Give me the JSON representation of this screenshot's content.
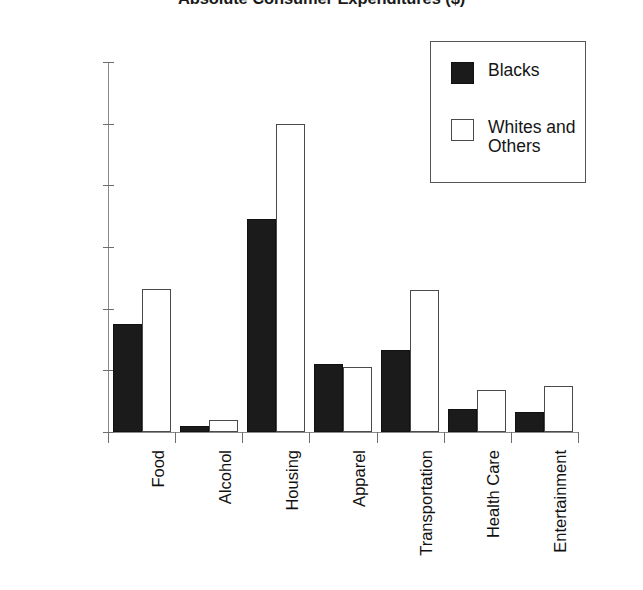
{
  "chart_data": {
    "type": "bar",
    "title": "Absolute Consumer Expenditures ($)",
    "xlabel": "",
    "ylabel": "",
    "ylim": [
      0,
      12000
    ],
    "grid": false,
    "legend_position": "top-right",
    "categories": [
      "Food",
      "Alcohol",
      "Housing",
      "Apparel",
      "Transportation",
      "Health Care",
      "Entertainment"
    ],
    "ytick_labels": [
      "0",
      "2,000",
      "4,000",
      "6,000",
      "8,000",
      "10,000",
      "12,000"
    ],
    "ytick_values": [
      0,
      2000,
      4000,
      6000,
      8000,
      10000,
      12000
    ],
    "series": [
      {
        "name": "Blacks",
        "color": "#1b1b1b",
        "fill": "solid",
        "values": [
          3500,
          200,
          6900,
          2200,
          2650,
          750,
          650
        ]
      },
      {
        "name": "Whites and Others",
        "color": "#ffffff",
        "fill": "outline",
        "values": [
          4650,
          400,
          10000,
          2100,
          4600,
          1350,
          1500
        ]
      }
    ]
  },
  "legend": {
    "entries": [
      {
        "label": "Blacks"
      },
      {
        "label": "Whites and Others"
      }
    ]
  }
}
